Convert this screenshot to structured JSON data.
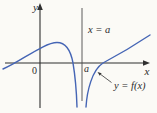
{
  "figure": {
    "type": "function-graph",
    "labels": {
      "y_axis": "y",
      "x_axis": "x",
      "origin": "0",
      "asymptote": "x = a",
      "a_point": "a",
      "curve": "y = f(x)"
    },
    "colors": {
      "background": "#fbfaf6",
      "axis": "#2f2f2f",
      "asymptote": "#4a4a4a",
      "curve": "#4565b5",
      "leader": "#333333"
    },
    "geometry": {
      "left_branch_path": "M 3 69 C 20 62, 44 42.5, 57 42.5 C 66 42.5, 71 52, 73 63 C 75 75, 76.5 91, 77 107",
      "right_branch_path": "M 86 107 C 87 91, 92 70, 103 63 C 119 54.5, 135 45, 150 35",
      "x_axis_line": "M 5 63 L 144 63",
      "y_axis_line": "M 40 9 L 40 108",
      "asymptote_line": "M 82 8 L 82 101",
      "leader_line": "M 111.5 82.5 L 100.5 74.3",
      "x_arrowhead": "150,63 143,60.3 143,65.7",
      "y_arrowhead": "40,3 37.2,10 42.8,10",
      "leader_arrowhead": "97.5,72 101.6,73.2 99.8,75.8"
    }
  }
}
